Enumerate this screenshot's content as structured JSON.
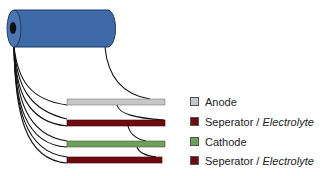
{
  "diagram": {
    "title": "",
    "cylinder": {
      "color": "#3f6aa8",
      "stroke": "#1f3a66",
      "core_color": "#111111"
    },
    "layers": [
      {
        "name": "anode",
        "color": "#c7c7c7",
        "x": 67,
        "y": 99,
        "w": 98,
        "h": 6
      },
      {
        "name": "separator-1",
        "color": "#6e0b10",
        "x": 67,
        "y": 120,
        "w": 98,
        "h": 6
      },
      {
        "name": "cathode",
        "color": "#6ea05a",
        "x": 67,
        "y": 141,
        "w": 98,
        "h": 6
      },
      {
        "name": "separator-2",
        "color": "#6e0b10",
        "x": 67,
        "y": 157,
        "w": 95,
        "h": 6
      }
    ]
  },
  "legend": {
    "items": [
      {
        "label": "Anode",
        "italic_suffix": "",
        "color": "#c7c7c7"
      },
      {
        "label": "Seperator / ",
        "italic_suffix": "Electrolyte",
        "color": "#6e0b10"
      },
      {
        "label": "Cathode",
        "italic_suffix": "",
        "color": "#6ea05a"
      },
      {
        "label": "Seperator / ",
        "italic_suffix": "Electrolyte",
        "color": "#6e0b10"
      }
    ]
  }
}
